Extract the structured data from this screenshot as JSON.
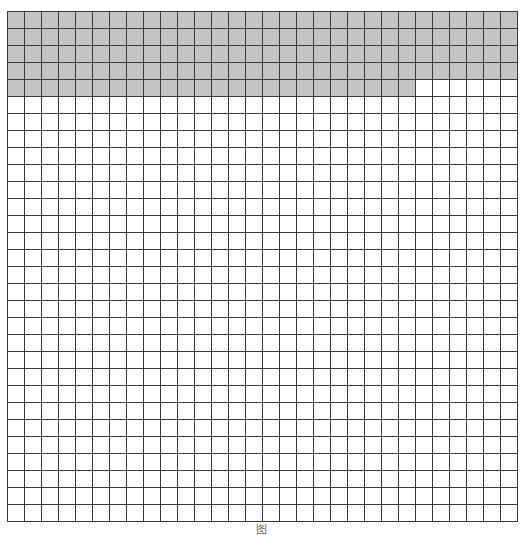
{
  "figure": {
    "type": "hundred-grid-shading",
    "rows": 30,
    "cols": 30,
    "cell_size_px": 17,
    "shaded_cells": 144,
    "total_cells": 900,
    "shaded_description": "4 full rows plus 24 cells of the 5th row shaded, filled left-to-right from top",
    "colors": {
      "shade": "#c4c4c4",
      "line": "#3a3a3a",
      "background": "#ffffff"
    },
    "caption": "图"
  }
}
